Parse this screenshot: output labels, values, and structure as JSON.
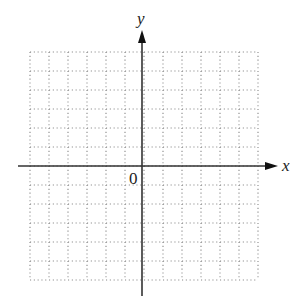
{
  "diagram": {
    "type": "coordinate-plane",
    "x_axis_label": "x",
    "y_axis_label": "y",
    "origin_label": "0",
    "grid": {
      "style": "dotted",
      "columns": 12,
      "rows": 12,
      "cell_size_px": 19,
      "left_px": 30,
      "top_px": 52,
      "color": "#888888"
    },
    "axes": {
      "color": "#333333",
      "origin_px": [
        142,
        166
      ],
      "x_start_px": 18,
      "x_end_px": 278,
      "y_start_px": 296,
      "y_end_px": 30
    },
    "background": "#ffffff"
  }
}
